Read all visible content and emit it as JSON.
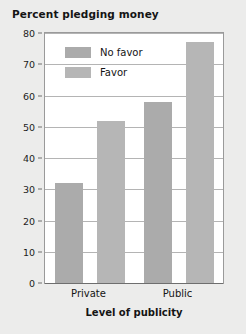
{
  "chart_data": {
    "type": "bar",
    "title": "Percent pledging money",
    "xlabel": "Level of publicity",
    "ylabel": "",
    "categories": [
      "Private",
      "Public"
    ],
    "series": [
      {
        "name": "No favor",
        "values": [
          32,
          58
        ],
        "color": "#ababab"
      },
      {
        "name": "Favor",
        "values": [
          52,
          77
        ],
        "color": "#b6b6b6"
      }
    ],
    "ylim": [
      0,
      80
    ],
    "ytick_step": 10,
    "yticks": [
      0,
      10,
      20,
      30,
      40,
      50,
      60,
      70,
      80
    ],
    "ytick_labels": [
      "0",
      "10",
      "20",
      "30",
      "40",
      "50",
      "60",
      "70",
      "80"
    ],
    "grid": true,
    "legend_position": "upper-left-inside",
    "background": "#ececeb",
    "plot_background": "#ffffff",
    "axis_color": "#6e6e6e",
    "grid_color": "#b4b4b4"
  }
}
